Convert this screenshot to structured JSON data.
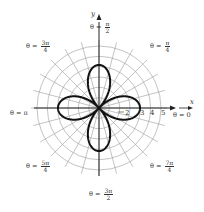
{
  "chart_data": {
    "type": "polar",
    "title": "",
    "curve": {
      "equation_form": "r = a cos(2θ)",
      "amplitude": 3,
      "petals": 4,
      "petal_directions": [
        "θ = 0",
        "θ = π/2",
        "θ = π",
        "θ = 3π/2"
      ]
    },
    "grid": {
      "rings": 6,
      "spoke_step_deg": 15
    },
    "radial_tick_labels": [
      "2",
      "3",
      "4",
      "5"
    ],
    "axes": {
      "x_label": "x",
      "y_label": "y"
    },
    "angle_labels": [
      {
        "id": "t0",
        "prefix": "θ = ",
        "text": "0"
      },
      {
        "id": "t1",
        "prefix": "θ = ",
        "num": "π",
        "den": "4"
      },
      {
        "id": "t2",
        "prefix": "θ = ",
        "num": "π",
        "den": "2"
      },
      {
        "id": "t3",
        "prefix": "θ = ",
        "num": "3π",
        "den": "4"
      },
      {
        "id": "t4",
        "prefix": "θ = ",
        "text": "π"
      },
      {
        "id": "t5",
        "prefix": "θ = ",
        "num": "5π",
        "den": "4"
      },
      {
        "id": "t6",
        "prefix": "θ = ",
        "num": "3π",
        "den": "2"
      },
      {
        "id": "t7",
        "prefix": "θ = ",
        "num": "7π",
        "den": "4"
      }
    ]
  },
  "colors": {
    "grid": "#9a9a9a",
    "curve": "#111111",
    "axis": "#222222"
  },
  "labels": {
    "x": "x",
    "y": "y",
    "tick2": "2",
    "tick3": "3",
    "tick4": "4",
    "tick5": "5",
    "theta_prefix": "θ =",
    "t0": "0",
    "t4": "π",
    "t1_num": "π",
    "t1_den": "4",
    "t2_num": "π",
    "t2_den": "2",
    "t3_num": "3π",
    "t3_den": "4",
    "t5_num": "5π",
    "t5_den": "4",
    "t6_num": "3π",
    "t6_den": "2",
    "t7_num": "7π",
    "t7_den": "4"
  }
}
